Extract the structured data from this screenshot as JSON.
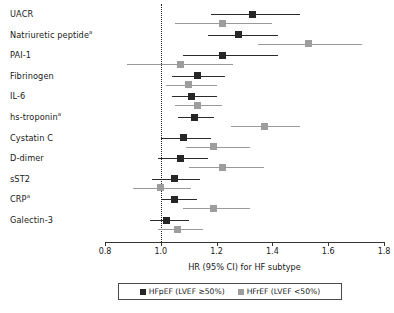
{
  "chart_data": {
    "type": "scatter",
    "title": "",
    "xlabel": "HR (95% CI) for HF subtype",
    "ylabel": "",
    "xlim": [
      0.8,
      1.8
    ],
    "xticks": [
      "0.8",
      "1.0",
      "1.2",
      "1.4",
      "1.6",
      "1.8"
    ],
    "reference_line": 1.0,
    "grid": false,
    "legend_position": "bottom",
    "categories": [
      "UACR",
      "Natriuretic peptide",
      "PAI-1",
      "Fibrinogen",
      "IL-6",
      "hs-troponin",
      "Cystatin C",
      "D-dimer",
      "sST2",
      "CRP",
      "Galectin-3"
    ],
    "footnote_markers": {
      "Natriuretic peptide": "a",
      "hs-troponin": "a",
      "CRP": "a"
    },
    "series": [
      {
        "name": "HFpEF (LVEF ≥50%)",
        "color": "#262626",
        "values": [
          1.33,
          1.28,
          1.22,
          1.13,
          1.11,
          1.12,
          1.08,
          1.07,
          1.05,
          1.05,
          1.02
        ],
        "ci_low": [
          1.18,
          1.17,
          1.08,
          1.04,
          1.04,
          1.06,
          1.0,
          0.99,
          0.97,
          1.0,
          0.96
        ],
        "ci_high": [
          1.5,
          1.42,
          1.42,
          1.23,
          1.2,
          1.19,
          1.18,
          1.17,
          1.14,
          1.13,
          1.1
        ]
      },
      {
        "name": "HFrEF (LVEF <50%)",
        "color": "#9d9d9d",
        "values": [
          1.22,
          1.53,
          1.07,
          1.1,
          1.13,
          1.37,
          1.19,
          1.22,
          1.0,
          1.19,
          1.06
        ],
        "ci_low": [
          1.05,
          1.35,
          0.88,
          1.02,
          1.05,
          1.25,
          1.09,
          1.1,
          0.9,
          1.08,
          0.99
        ],
        "ci_high": [
          1.4,
          1.72,
          1.26,
          1.2,
          1.22,
          1.5,
          1.32,
          1.37,
          1.11,
          1.32,
          1.15
        ]
      }
    ]
  },
  "legend": {
    "items": [
      {
        "label": "HFpEF (LVEF ≥50%)",
        "color": "#262626"
      },
      {
        "label": "HFrEF (LVEF <50%)",
        "color": "#9d9d9d"
      }
    ]
  }
}
